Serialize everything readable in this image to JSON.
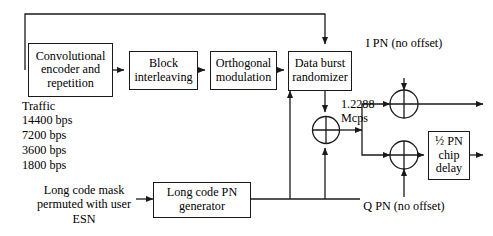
{
  "diagram": {
    "blocks": [
      {
        "id": "conv-encoder",
        "label": "Convolutional\nencoder and\nrepetition"
      },
      {
        "id": "block-interleaving",
        "label": "Block\ninterleaving"
      },
      {
        "id": "orthogonal-modulation",
        "label": "Orthogonal\nmodulation"
      },
      {
        "id": "data-burst-randomizer",
        "label": "Data burst\nrandomizer"
      },
      {
        "id": "long-code-pn-generator",
        "label": "Long code PN\ngenerator"
      },
      {
        "id": "half-pn-chip-delay",
        "label": "½ PN\nchip\ndelay"
      }
    ],
    "labels": {
      "traffic_heading": "Traffic",
      "traffic_rates": [
        "14400 bps",
        "7200 bps",
        "3600 bps",
        "1800 bps"
      ],
      "long_code_mask": "Long code mask\npermuted with user\nESN",
      "chip_rate": "1.2288\nMcps",
      "i_pn": "I PN (no offset)",
      "q_pn": "Q PN (no offset)"
    },
    "operators": [
      {
        "id": "xor-long-code",
        "symbol": "⊕"
      },
      {
        "id": "xor-i-channel",
        "symbol": "⊕"
      },
      {
        "id": "xor-q-channel",
        "symbol": "⊕"
      }
    ],
    "colors": {
      "line": "#1a1a1a",
      "background": "#ffffff",
      "text": "#000000"
    }
  }
}
